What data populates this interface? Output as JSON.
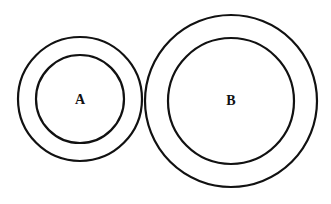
{
  "diagram": {
    "width": 331,
    "height": 204,
    "background": "#ffffff",
    "stroke_color": "#111111",
    "circles": [
      {
        "label": "A",
        "cx": 80,
        "cy": 99,
        "outer_r": 62,
        "inner_r": 44
      },
      {
        "label": "B",
        "cx": 231,
        "cy": 101,
        "outer_r": 86,
        "inner_r": 63
      }
    ]
  }
}
